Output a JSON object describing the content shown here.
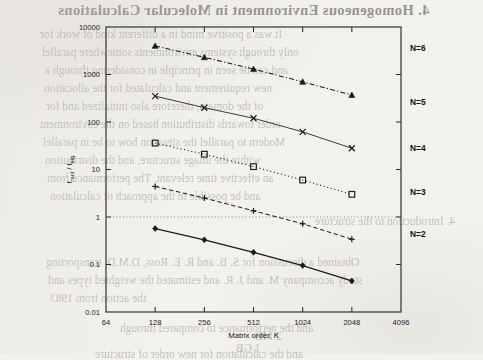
{
  "page": {
    "bleed_through": [
      {
        "text": "4. Homogeneous Environment in Molecular Calculations",
        "style": "head",
        "x": 58,
        "y": 2
      },
      {
        "text": "It was a positive mind in a different kind of work for",
        "style": "body",
        "x": 40,
        "y": 28
      },
      {
        "text": "only through systems environments somewhere parallel",
        "style": "body",
        "x": 42,
        "y": 46
      },
      {
        "text": "and can be seen in principle in considering through a",
        "style": "body",
        "x": 45,
        "y": 64
      },
      {
        "text": "new requirement and calculated for the allocation",
        "style": "body",
        "x": 44,
        "y": 82
      },
      {
        "text": "of the domain, therefore also initialized and for",
        "style": "body",
        "x": 46,
        "y": 100
      },
      {
        "text": "order towards distribution based on the environment",
        "style": "body",
        "x": 40,
        "y": 118
      },
      {
        "text": "Modern to parallel the situation how to be in parallel",
        "style": "body",
        "x": 43,
        "y": 136
      },
      {
        "text": "within the image structure, and the distribution",
        "style": "body",
        "x": 45,
        "y": 154
      },
      {
        "text": "an effective time relevant. The performance from",
        "style": "body",
        "x": 47,
        "y": 172
      },
      {
        "text": "and be possible in the approach of calculation",
        "style": "body",
        "x": 50,
        "y": 190
      },
      {
        "text": "4. Introduction to the structure",
        "style": "body",
        "x": 315,
        "y": 215
      },
      {
        "text": "Obtained a discussion for S. B. and R. E. Ross, D.M.D. transporting",
        "style": "body",
        "x": 46,
        "y": 256
      },
      {
        "text": "study accompany M. and J. R. and estimated the weighted types and",
        "style": "body",
        "x": 48,
        "y": 274
      },
      {
        "text": "the action from 1983",
        "style": "body",
        "x": 50,
        "y": 292
      },
      {
        "text": "and the performance to compared through",
        "style": "body",
        "x": 120,
        "y": 322
      },
      {
        "text": "2 MB",
        "style": "body",
        "x": 255,
        "y": 330
      },
      {
        "text": "1 GB",
        "style": "body",
        "x": 236,
        "y": 342
      },
      {
        "text": "and the calculation for new order of structure",
        "style": "body",
        "x": 95,
        "y": 348
      }
    ]
  },
  "chart_data": {
    "type": "line",
    "title": "",
    "xlabel": "Matrix order, K",
    "ylabel": "t_mol / t_eig",
    "ylabel_parts": {
      "lead": "t",
      "sub1": "mol",
      "mid": " / t",
      "sub2": "eig"
    },
    "xscale": "log2",
    "yscale": "log10",
    "xlim": [
      64,
      4096
    ],
    "ylim": [
      0.01,
      10000
    ],
    "xticks": [
      64,
      128,
      256,
      512,
      1024,
      2048,
      4096
    ],
    "xtick_labels": [
      "64",
      "128",
      "256",
      "512",
      "1024",
      "2048",
      "4096"
    ],
    "yticks": [
      0.01,
      0.1,
      1,
      10,
      100,
      1000,
      10000
    ],
    "ytick_labels": [
      "0.01",
      "0.1",
      "1",
      "10",
      "100",
      "1000",
      "10000"
    ],
    "grid": false,
    "reference_line": {
      "y": 1,
      "style": "dotted"
    },
    "legend_position": "inline-right",
    "x": [
      128,
      256,
      512,
      1024,
      2048
    ],
    "series": [
      {
        "name": "N=6",
        "label": "N=6",
        "values": [
          4000,
          2300,
          1300,
          700,
          370
        ],
        "marker": "triangle-filled",
        "line": "dashdot",
        "label_y": 3600
      },
      {
        "name": "N=5",
        "label": "N=5",
        "values": [
          350,
          200,
          120,
          62,
          28
        ],
        "marker": "cross-x",
        "line": "solid-thin",
        "label_y": 260
      },
      {
        "name": "N=4",
        "label": "N=4",
        "values": [
          36,
          21,
          11.5,
          6.0,
          3.0
        ],
        "marker": "square-open",
        "line": "dotted",
        "label_y": 28
      },
      {
        "name": "N=3",
        "label": "N=3",
        "values": [
          4.4,
          2.5,
          1.35,
          0.72,
          0.34
        ],
        "marker": "plus",
        "line": "dashed",
        "label_y": 3.3
      },
      {
        "name": "N=2",
        "label": "N=2",
        "values": [
          0.57,
          0.33,
          0.18,
          0.095,
          0.045
        ],
        "marker": "diamond-filled",
        "line": "solid",
        "label_y": 0.43
      }
    ]
  },
  "colors": {
    "ink": "#1a1a1a",
    "paper": "#f2f1ee",
    "reference": "#6d6d6d"
  }
}
